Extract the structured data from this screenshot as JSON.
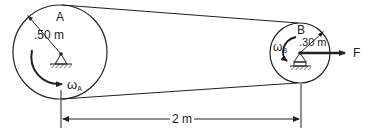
{
  "diagram": {
    "type": "belt-pulley-system",
    "pulley_a": {
      "label": "A",
      "radius_label": ".50 m",
      "omega_symbol": "ω",
      "omega_subscript": "A"
    },
    "pulley_b": {
      "label": "B",
      "radius_label": ".30 m",
      "omega_symbol": "ω",
      "omega_subscript": "B"
    },
    "force_label": "F",
    "center_distance_label": "2 m",
    "colors": {
      "line": "#222222",
      "background": "#ffffff"
    }
  }
}
